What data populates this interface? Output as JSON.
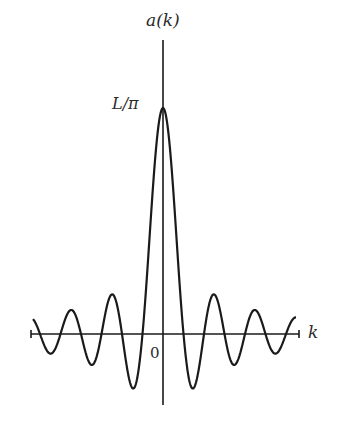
{
  "chart_data": {
    "type": "line",
    "title": "",
    "ylabel": "a(k)",
    "xlabel": "k",
    "peak_label": "L/π",
    "origin_label": "0",
    "function": "sinc-like: a(k) = (L/π) · sin(kL/2)/(kL/2)",
    "grid": false,
    "legend": null,
    "x_range": [
      -6.5,
      6.5
    ],
    "y_range": [
      -0.35,
      1.1
    ],
    "zero_crossings": [
      -6,
      -5,
      -4,
      -3,
      -2,
      -1,
      1,
      2,
      3,
      4,
      5,
      6
    ],
    "peak": {
      "x": 0,
      "y": 1.0
    },
    "series": [
      {
        "name": "a(k)",
        "x": [
          -6.5,
          -6,
          -5.5,
          -5,
          -4.5,
          -4,
          -3.5,
          -3,
          -2.5,
          -2,
          -1.5,
          -1,
          -0.5,
          0,
          0.5,
          1,
          1.5,
          2,
          2.5,
          3,
          3.5,
          4,
          4.5,
          5,
          5.5,
          6,
          6.5
        ],
        "values": [
          0.05,
          0,
          -0.05,
          0,
          0.08,
          0,
          -0.075,
          0,
          0.14,
          0,
          -0.18,
          0,
          0.64,
          1.0,
          0.64,
          0,
          -0.18,
          0,
          0.14,
          0,
          -0.075,
          0,
          0.08,
          0,
          -0.05,
          0,
          0.05
        ]
      }
    ],
    "pixel_geometry": {
      "origin_px": [
        163,
        334
      ],
      "peak_px_y": 108,
      "zero_spacing_px": 20.5,
      "x_axis_px": [
        31,
        299
      ],
      "y_axis_px": [
        40,
        405
      ]
    }
  },
  "labels": {
    "y_axis": "a(k)",
    "peak": "L/π",
    "x_axis": "k",
    "origin": "0"
  },
  "colors": {
    "stroke": "#1a1a1a",
    "background": "#ffffff"
  }
}
